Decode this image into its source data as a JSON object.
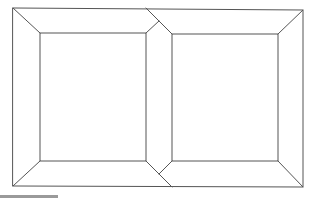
{
  "diagram": {
    "stroke_color": "#555555",
    "background": "#ffffff",
    "outer_frame": {
      "x1": 13,
      "y1": 8,
      "x2": 303,
      "y2": 187
    },
    "panels": [
      {
        "name": "left-panel",
        "inner": {
          "x1": 40,
          "y1": 33,
          "x2": 146,
          "y2": 161
        }
      },
      {
        "name": "right-panel",
        "inner": {
          "x1": 172,
          "y1": 34,
          "x2": 278,
          "y2": 161
        }
      }
    ],
    "footer_bar_color": "#9a9a9a"
  }
}
